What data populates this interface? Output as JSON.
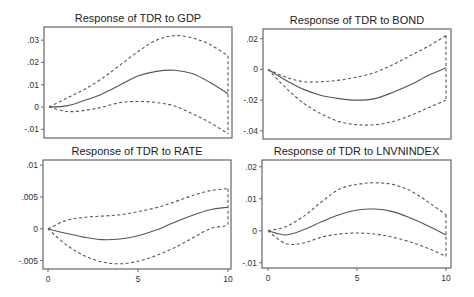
{
  "chart_data": [
    {
      "type": "line",
      "title": "Response of TDR to GDP",
      "x": [
        0,
        1,
        2,
        3,
        4,
        5,
        6,
        7,
        8,
        9,
        10
      ],
      "xlabel": "",
      "ylabel": "",
      "ylim": [
        -0.013,
        0.035
      ],
      "yticks": [
        0.03,
        0.02,
        0.01,
        0,
        -0.01
      ],
      "ytick_labels": [
        ".03",
        ".02",
        ".01",
        "0",
        "-.01"
      ],
      "xticks": [],
      "series": [
        {
          "name": "response",
          "style": "solid",
          "values": [
            0,
            0.0005,
            0.003,
            0.006,
            0.01,
            0.014,
            0.016,
            0.0165,
            0.015,
            0.011,
            0.006
          ]
        },
        {
          "name": "upper",
          "style": "dashed",
          "values": [
            0,
            0.004,
            0.008,
            0.013,
            0.019,
            0.025,
            0.03,
            0.032,
            0.031,
            0.028,
            0.023
          ]
        },
        {
          "name": "lower",
          "style": "dashed",
          "values": [
            0,
            -0.002,
            -0.0015,
            0,
            0.002,
            0.0025,
            0.002,
            0.0005,
            -0.003,
            -0.007,
            -0.012
          ]
        }
      ]
    },
    {
      "type": "line",
      "title": "Response of TDR to BOND",
      "x": [
        0,
        1,
        2,
        3,
        4,
        5,
        6,
        7,
        8,
        9,
        10
      ],
      "xlabel": "",
      "ylabel": "",
      "ylim": [
        -0.044,
        0.025
      ],
      "yticks": [
        0.02,
        0,
        -0.02,
        -0.04
      ],
      "ytick_labels": [
        ".02",
        "0",
        "-.02",
        "-.04"
      ],
      "xticks": [],
      "series": [
        {
          "name": "response",
          "style": "solid",
          "values": [
            0,
            -0.007,
            -0.013,
            -0.017,
            -0.019,
            -0.02,
            -0.019,
            -0.015,
            -0.01,
            -0.004,
            0.001
          ]
        },
        {
          "name": "upper",
          "style": "dashed",
          "values": [
            0,
            -0.005,
            -0.008,
            -0.008,
            -0.007,
            -0.005,
            -0.002,
            0.003,
            0.009,
            0.015,
            0.022
          ]
        },
        {
          "name": "lower",
          "style": "dashed",
          "values": [
            0,
            -0.012,
            -0.022,
            -0.029,
            -0.034,
            -0.036,
            -0.036,
            -0.034,
            -0.03,
            -0.025,
            -0.02
          ]
        }
      ]
    },
    {
      "type": "line",
      "title": "Response of TDR to RATE",
      "x": [
        0,
        1,
        2,
        3,
        4,
        5,
        6,
        7,
        8,
        9,
        10
      ],
      "xlabel": "",
      "ylabel": "",
      "ylim": [
        -0.006,
        0.0105
      ],
      "yticks": [
        0.01,
        0.005,
        0,
        -0.005
      ],
      "ytick_labels": [
        ".01",
        ".005",
        "0",
        "-.005"
      ],
      "xticks": [
        0,
        5,
        10
      ],
      "xtick_labels": [
        "0",
        "5",
        "10"
      ],
      "series": [
        {
          "name": "response",
          "style": "solid",
          "values": [
            0,
            -0.0007,
            -0.0013,
            -0.0017,
            -0.0016,
            -0.0011,
            -0.0002,
            0.001,
            0.0021,
            0.003,
            0.0034
          ]
        },
        {
          "name": "upper",
          "style": "dashed",
          "values": [
            0,
            0.0013,
            0.0018,
            0.002,
            0.0022,
            0.0027,
            0.0033,
            0.0042,
            0.0052,
            0.006,
            0.0063
          ]
        },
        {
          "name": "lower",
          "style": "dashed",
          "values": [
            0,
            -0.0025,
            -0.0042,
            -0.0052,
            -0.0055,
            -0.0051,
            -0.0042,
            -0.003,
            -0.0015,
            0,
            0.0005
          ]
        }
      ]
    },
    {
      "type": "line",
      "title": "Response of TDR to LNVNINDEX",
      "x": [
        0,
        1,
        2,
        3,
        4,
        5,
        6,
        7,
        8,
        9,
        10
      ],
      "xlabel": "",
      "ylabel": "",
      "ylim": [
        -0.011,
        0.0215
      ],
      "yticks": [
        0.02,
        0.01,
        0,
        -0.01
      ],
      "ytick_labels": [
        ".02",
        ".01",
        "0",
        "-.01"
      ],
      "xticks": [
        0,
        5,
        10
      ],
      "xtick_labels": [
        "0",
        "5",
        "10"
      ],
      "series": [
        {
          "name": "response",
          "style": "solid",
          "values": [
            0,
            -0.0013,
            0.0003,
            0.0028,
            0.005,
            0.0065,
            0.0068,
            0.006,
            0.004,
            0.0015,
            -0.0013
          ]
        },
        {
          "name": "upper",
          "style": "dashed",
          "values": [
            0,
            0.0013,
            0.0045,
            0.009,
            0.013,
            0.0145,
            0.015,
            0.0145,
            0.0125,
            0.009,
            0.005
          ]
        },
        {
          "name": "lower",
          "style": "dashed",
          "values": [
            0,
            -0.004,
            -0.0038,
            -0.002,
            -0.001,
            -0.0007,
            -0.001,
            -0.002,
            -0.0035,
            -0.0055,
            -0.008
          ]
        }
      ]
    }
  ],
  "layout": [
    {
      "frame": [
        44,
        27,
        232,
        138
      ],
      "x0": 49,
      "x10": 228
    },
    {
      "frame": [
        263,
        29,
        451,
        139
      ],
      "x0": 268,
      "x10": 446
    },
    {
      "frame": [
        43,
        160,
        231,
        269
      ],
      "x0": 48,
      "x10": 228
    },
    {
      "frame": [
        262,
        160,
        451,
        268
      ],
      "x0": 268,
      "x10": 446
    }
  ],
  "colors": {
    "line": "#555555",
    "frame": "#666666",
    "background": "#ffffff"
  }
}
